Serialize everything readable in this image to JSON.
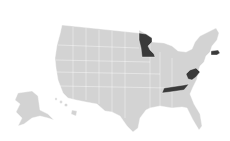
{
  "map": {
    "type": "choropleth",
    "region": "United States",
    "base_color": "#d3d3d3",
    "highlight_color": "#3a3a3a",
    "background": "#ffffff",
    "highlighted_states": [
      "Minnesota",
      "Massachusetts",
      "West Virginia",
      "Tennessee"
    ]
  }
}
